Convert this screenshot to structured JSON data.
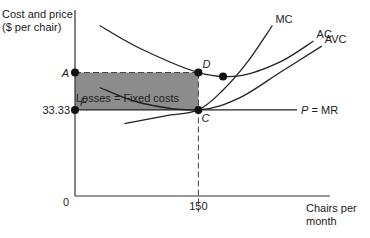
{
  "chart_data": {
    "type": "line",
    "title": "",
    "ylabel_lines": [
      "Cost and price",
      "($ per chair)"
    ],
    "xlabel_lines": [
      "Chairs per",
      "month"
    ],
    "origin_label": "0",
    "x_ticks": [
      {
        "value": 150,
        "label": "150"
      }
    ],
    "y_ticks": [
      {
        "value": 33.33,
        "label": "33.33"
      }
    ],
    "series": [
      {
        "name": "MC",
        "label": "MC",
        "points": [
          [
            60,
            28
          ],
          [
            110,
            31
          ],
          [
            150,
            33.33
          ],
          [
            180,
            41
          ],
          [
            210,
            52
          ],
          [
            240,
            66
          ]
        ]
      },
      {
        "name": "AC",
        "label": "AC",
        "points": [
          [
            30,
            66
          ],
          [
            80,
            57
          ],
          [
            150,
            47.8
          ],
          [
            200,
            46.5
          ],
          [
            250,
            52
          ],
          [
            290,
            60
          ]
        ]
      },
      {
        "name": "AVC",
        "label": "AVC",
        "points": [
          [
            30,
            42
          ],
          [
            80,
            36
          ],
          [
            150,
            33.33
          ],
          [
            200,
            38
          ],
          [
            250,
            48
          ],
          [
            300,
            58
          ]
        ]
      },
      {
        "name": "P = MR",
        "label": "P = MR",
        "label_italic_part": "P",
        "points": [
          [
            0,
            33.33
          ],
          [
            270,
            33.33
          ]
        ]
      }
    ],
    "points": [
      {
        "id": "A",
        "label": "A",
        "x": 0,
        "y": 47.8
      },
      {
        "id": "D",
        "label": "D",
        "x": 150,
        "y": 47.8
      },
      {
        "id": "F",
        "label": "F",
        "x": 0,
        "y": 33.33
      },
      {
        "id": "C",
        "label": "C",
        "x": 150,
        "y": 33.33
      },
      {
        "id": "min-AC",
        "label": "",
        "x": 180,
        "y": 46.3
      }
    ],
    "shaded_region": {
      "label": "Losses = Fixed costs",
      "x": [
        0,
        150
      ],
      "y": [
        33.33,
        47.8
      ],
      "color": "#8c8c8c"
    },
    "annotation": "Losses = Fixed costs",
    "xlim": [
      0,
      310
    ],
    "ylim": [
      0,
      72
    ],
    "grid": false,
    "legend": "none"
  }
}
